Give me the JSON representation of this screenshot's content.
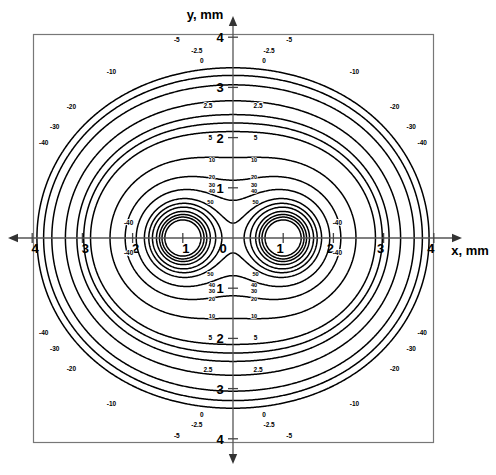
{
  "figure": {
    "type": "contour-plot",
    "axis_x_label": "x, mm",
    "axis_y_label": "y, mm",
    "x_ticks": [
      "4",
      "3",
      "2",
      "1",
      "0",
      "1",
      "2",
      "3",
      "4"
    ],
    "y_ticks": [
      "4",
      "3",
      "2",
      "1",
      "1",
      "2",
      "3",
      "4"
    ],
    "origin_label": "0"
  },
  "chart_data": {
    "type": "line",
    "title": "",
    "xlabel": "x, mm",
    "ylabel": "y, mm",
    "xlim": [
      -4,
      4
    ],
    "ylim": [
      -4,
      4
    ],
    "grid": false,
    "legend": "none",
    "plot_kind": "contour",
    "singular_points": [
      {
        "x": -1,
        "y": 0
      },
      {
        "x": 1,
        "y": 0
      }
    ],
    "contour_levels": [
      50,
      40,
      30,
      20,
      10,
      5,
      2.5,
      0,
      -2.5,
      -5,
      -10,
      -20,
      -30,
      -40
    ],
    "contour_labels": [
      {
        "value": "50",
        "positions": [
          {
            "x": -0.45,
            "y": 0.72
          },
          {
            "x": 0.45,
            "y": 0.72
          },
          {
            "x": -0.45,
            "y": -0.72
          },
          {
            "x": 0.45,
            "y": -0.72
          }
        ]
      },
      {
        "value": "40",
        "positions": [
          {
            "x": -0.42,
            "y": 0.93
          },
          {
            "x": 0.42,
            "y": 0.93
          },
          {
            "x": -0.42,
            "y": -0.93
          },
          {
            "x": 0.42,
            "y": -0.93
          }
        ]
      },
      {
        "value": "30",
        "positions": [
          {
            "x": -0.42,
            "y": 1.06
          },
          {
            "x": 0.42,
            "y": 1.06
          },
          {
            "x": -0.42,
            "y": -1.06
          },
          {
            "x": 0.42,
            "y": -1.06
          }
        ]
      },
      {
        "value": "20",
        "positions": [
          {
            "x": -0.42,
            "y": 1.22
          },
          {
            "x": 0.42,
            "y": 1.22
          },
          {
            "x": -0.42,
            "y": -1.22
          },
          {
            "x": 0.42,
            "y": -1.22
          }
        ]
      },
      {
        "value": "10",
        "positions": [
          {
            "x": -0.42,
            "y": 1.55
          },
          {
            "x": 0.42,
            "y": 1.55
          },
          {
            "x": -0.42,
            "y": -1.55
          },
          {
            "x": 0.42,
            "y": -1.55
          }
        ]
      },
      {
        "value": "5",
        "positions": [
          {
            "x": -0.45,
            "y": 2.0
          },
          {
            "x": 0.45,
            "y": 2.0
          },
          {
            "x": -0.45,
            "y": -2.0
          },
          {
            "x": 0.45,
            "y": -2.0
          }
        ]
      },
      {
        "value": "2.5",
        "positions": [
          {
            "x": -0.5,
            "y": 2.62
          },
          {
            "x": 0.5,
            "y": 2.62
          },
          {
            "x": -0.5,
            "y": -2.62
          },
          {
            "x": 0.5,
            "y": -2.62
          }
        ]
      },
      {
        "value": "0",
        "positions": [
          {
            "x": -0.62,
            "y": 3.52
          },
          {
            "x": 0.62,
            "y": 3.52
          },
          {
            "x": -0.62,
            "y": -3.52
          },
          {
            "x": 0.62,
            "y": -3.52
          }
        ]
      },
      {
        "value": "-2.5",
        "positions": [
          {
            "x": -0.72,
            "y": 3.73
          },
          {
            "x": 0.72,
            "y": 3.73
          },
          {
            "x": -0.72,
            "y": -3.73
          },
          {
            "x": 0.72,
            "y": -3.73
          }
        ]
      },
      {
        "value": "-5",
        "positions": [
          {
            "x": -1.12,
            "y": 3.95
          },
          {
            "x": 1.12,
            "y": 3.95
          },
          {
            "x": -1.12,
            "y": -3.95
          },
          {
            "x": 1.12,
            "y": -3.95
          }
        ]
      },
      {
        "value": "-10",
        "positions": [
          {
            "x": -2.42,
            "y": 3.3
          },
          {
            "x": 2.42,
            "y": 3.3
          },
          {
            "x": -2.42,
            "y": -3.3
          },
          {
            "x": 2.42,
            "y": -3.3
          }
        ]
      },
      {
        "value": "-20",
        "positions": [
          {
            "x": -3.22,
            "y": 2.6
          },
          {
            "x": 3.22,
            "y": 2.6
          },
          {
            "x": -3.22,
            "y": -2.6
          },
          {
            "x": 3.22,
            "y": -2.6
          }
        ]
      },
      {
        "value": "-30",
        "positions": [
          {
            "x": -3.55,
            "y": 2.22
          },
          {
            "x": 3.55,
            "y": 2.22
          },
          {
            "x": -3.55,
            "y": -2.22
          },
          {
            "x": 3.55,
            "y": -2.22
          }
        ]
      },
      {
        "value": "-40",
        "positions": [
          {
            "x": -3.77,
            "y": 1.9
          },
          {
            "x": 3.77,
            "y": 1.9
          },
          {
            "x": -3.77,
            "y": -1.9
          },
          {
            "x": 3.77,
            "y": -1.9
          }
        ]
      },
      {
        "value": "-40",
        "positions": [
          {
            "x": -2.08,
            "y": 0.3
          },
          {
            "x": 2.08,
            "y": 0.3
          },
          {
            "x": -2.08,
            "y": -0.3
          },
          {
            "x": 2.08,
            "y": -0.3
          }
        ]
      }
    ]
  }
}
